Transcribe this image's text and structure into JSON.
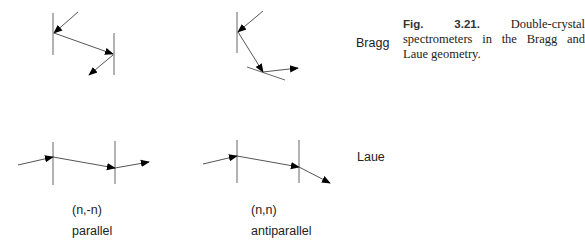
{
  "caption": {
    "figure_number": "Fig. 3.21.",
    "text": "Double-crystal spectrometers in the Bragg and Laue geometry."
  },
  "row_labels": {
    "bragg": "Bragg",
    "laue": "Laue"
  },
  "columns": [
    {
      "setting": "(n,-n)",
      "orientation": "parallel"
    },
    {
      "setting": "(n,n)",
      "orientation": "antiparallel"
    }
  ],
  "colors": {
    "line": "#555555",
    "arrow": "#000000",
    "text": "#222222"
  }
}
